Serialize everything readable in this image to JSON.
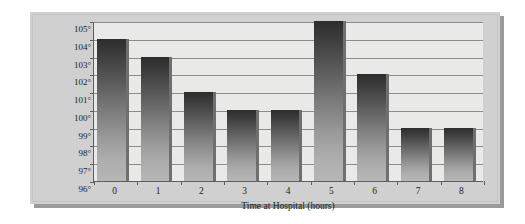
{
  "chart_data": {
    "type": "bar",
    "title": "",
    "xlabel": "Time at Hospital (hours)",
    "ylabel": "Temperature\n(degrees Fahrenheit)",
    "ylabel_line1": "Temperature",
    "ylabel_line2": "(degrees Fahrenheit)",
    "categories": [
      "0",
      "1",
      "2",
      "3",
      "4",
      "5",
      "6",
      "7",
      "8"
    ],
    "values": [
      104,
      103,
      101,
      100,
      100,
      105,
      102,
      99,
      99
    ],
    "ylim": [
      96,
      105
    ],
    "ytick_values": [
      96,
      97,
      98,
      99,
      100,
      101,
      102,
      103,
      104,
      105
    ],
    "ytick_labels": [
      "96°",
      "97°",
      "98°",
      "99°",
      "100°",
      "101°",
      "102°",
      "103°",
      "104°",
      "105°"
    ],
    "unit": "°F",
    "grid": true,
    "grid_axis": "y",
    "legend": false,
    "legend_position": "none",
    "bar_orientation": "vertical"
  },
  "style": {
    "panel_background": "#cfd0cf",
    "plot_background": "#e9eae8",
    "gridline_color": "#8b8d8b",
    "axis_color": "#5e5e5e",
    "bar_top_color": "#2d2d2d",
    "bar_bottom_color": "#b6b6b6",
    "bar_edge_color": "#6f6f6f",
    "text_color": "#1d1d1d",
    "page_background": "#ffffff",
    "shadow_color": "#9a9a9a"
  }
}
